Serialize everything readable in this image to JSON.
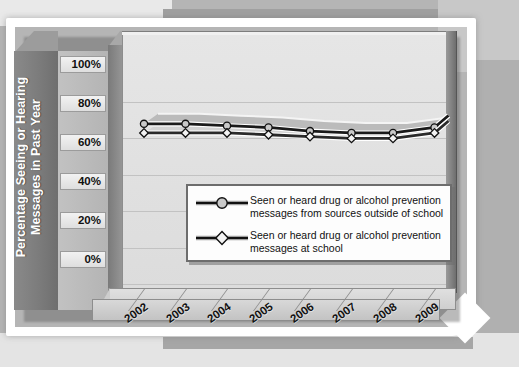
{
  "chart_data": {
    "type": "line",
    "title": "",
    "xlabel": "",
    "ylabel": "Percentage Seeing or Hearing Messages in Past Year",
    "categories": [
      "2002",
      "2003",
      "2004",
      "2005",
      "2006",
      "2007",
      "2008",
      "2009"
    ],
    "ylim": [
      0,
      100
    ],
    "ytick_labels": [
      "100%",
      "80%",
      "60%",
      "40%",
      "20%",
      "0%"
    ],
    "ytick_values": [
      100,
      80,
      60,
      40,
      20,
      0
    ],
    "grid": true,
    "legend_position": "center",
    "series": [
      {
        "name": "Seen or heard drug or alcohol prevention messages from sources outside of school",
        "marker": "circle",
        "color": "#1a1a1a",
        "marker_fill": "#c9c9c9",
        "values": [
          88,
          88,
          87,
          86,
          84,
          83,
          83,
          86
        ]
      },
      {
        "name": "Seen or heard drug or alcohol prevention messages at school",
        "marker": "diamond",
        "color": "#2a2a2a",
        "marker_fill": "#f2f2f2",
        "values": [
          83,
          83,
          83,
          82,
          81,
          80,
          80,
          83
        ]
      }
    ]
  },
  "axis": {
    "y_title": "Percentage Seeing or Hearing Messages in Past Year"
  },
  "legend": {
    "entries": [
      {
        "marker": "circle-marker-icon",
        "line1": "Seen or heard drug or alcohol prevention",
        "line2": "messages from sources outside of school"
      },
      {
        "marker": "diamond-marker-icon",
        "line1": "Seen or heard drug or alcohol prevention",
        "line2": "messages at school"
      }
    ]
  },
  "colors": {
    "page_background": "#b5b5b5",
    "frame": "#ffffff",
    "axis_wall": "#7c7c7c",
    "plot_background": "#e2e2e2",
    "series1": "#1a1a1a",
    "series2": "#2a2a2a",
    "ribbon": "#b8b8b8"
  }
}
